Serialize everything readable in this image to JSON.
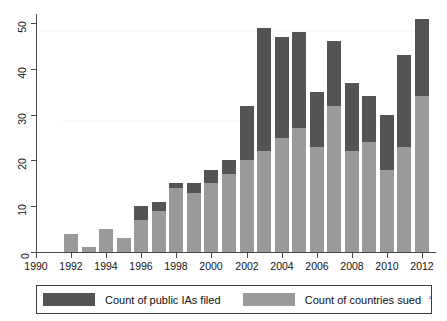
{
  "chart_data": {
    "type": "bar",
    "subtype": "overlaid-stacked",
    "title": "",
    "xlabel": "",
    "ylabel": "",
    "categories": [
      1992,
      1993,
      1994,
      1995,
      1996,
      1997,
      1998,
      1999,
      2000,
      2001,
      2002,
      2003,
      2004,
      2005,
      2006,
      2007,
      2008,
      2009,
      2010,
      2011,
      2012
    ],
    "series": [
      {
        "name": "Count of public IAs filed",
        "color": "#545454",
        "values": [
          4,
          1,
          5,
          3,
          10,
          11,
          15,
          15,
          18,
          20,
          32,
          49,
          47,
          48,
          35,
          46,
          37,
          34,
          30,
          43,
          51
        ]
      },
      {
        "name": "Count of countries sued",
        "color": "#9a9a9a",
        "values": [
          4,
          1,
          5,
          3,
          7,
          9,
          14,
          13,
          15,
          17,
          20,
          22,
          25,
          27,
          23,
          32,
          22,
          24,
          18,
          23,
          34
        ]
      }
    ],
    "x_ticks": [
      1990,
      1992,
      1994,
      1996,
      1998,
      2000,
      2002,
      2004,
      2006,
      2008,
      2010,
      2012
    ],
    "y_ticks": [
      0,
      10,
      20,
      30,
      40,
      50
    ],
    "xlim": [
      1990,
      2012.8
    ],
    "ylim": [
      0,
      52
    ],
    "grid": false,
    "legend_position": "bottom"
  },
  "axis": {
    "y_tick_labels": [
      "0",
      "10",
      "20",
      "30",
      "40",
      "50"
    ],
    "x_tick_labels": [
      "1990",
      "1992",
      "1994",
      "1996",
      "1998",
      "2000",
      "2002",
      "2004",
      "2006",
      "2008",
      "2010",
      "2012"
    ]
  },
  "legend": {
    "items": [
      {
        "label": "Count of public IAs filed",
        "swatch": "dark"
      },
      {
        "label": "Count of countries sued",
        "swatch": "light"
      }
    ],
    "footnote_marker": "²"
  },
  "colors": {
    "series_dark": "#545454",
    "series_light": "#9a9a9a",
    "axis": "#4a4a4a",
    "text": "#141414",
    "background": "#ffffff"
  }
}
